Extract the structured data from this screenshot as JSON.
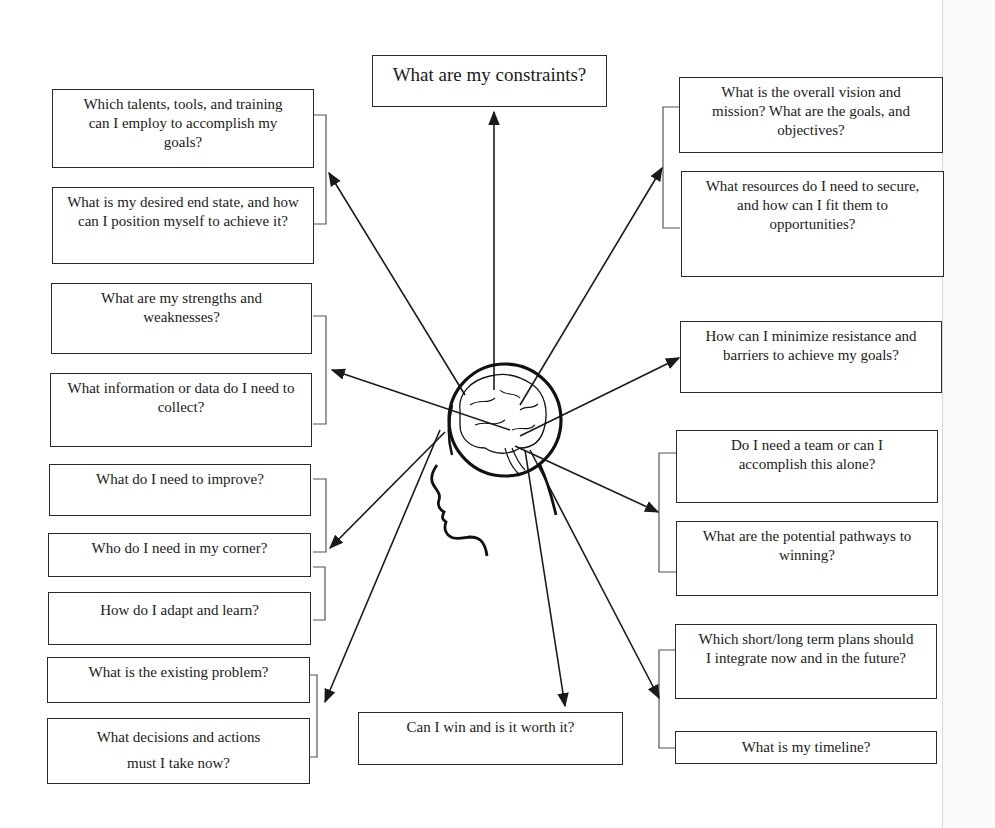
{
  "diagram": {
    "center": {
      "label": "head-with-brain"
    },
    "top": {
      "text": "What are my constraints?"
    },
    "bottom": {
      "text": "Can I win and is it worth it?"
    },
    "left_boxes": [
      {
        "text": "Which talents, tools, and training can I employ to accomplish my goals?"
      },
      {
        "text": "What is my desired end state, and how can I position myself to achieve it?"
      },
      {
        "text": "What are my strengths and weaknesses?"
      },
      {
        "text": "What information or data do I need to collect?"
      },
      {
        "text": "What do I need to improve?"
      },
      {
        "text": "Who do I need in my corner?"
      },
      {
        "text": "How do I adapt and learn?"
      },
      {
        "text": "What is the existing problem?"
      },
      {
        "text": "What decisions and actions must I take now?"
      }
    ],
    "right_boxes": [
      {
        "text": "What is the overall vision and mission? What are the goals, and objectives?"
      },
      {
        "text": "What resources do I need to secure, and how can I fit them to opportunities?"
      },
      {
        "text": "How can I minimize resistance and barriers to achieve my goals?"
      },
      {
        "text": "Do I need a team or can I accomplish this alone?"
      },
      {
        "text": "What are the potential pathways to winning?"
      },
      {
        "text": "Which short/long term plans should I integrate now and in the future?"
      },
      {
        "text": "What is my timeline?"
      }
    ],
    "colors": {
      "line": "#1a1a1a",
      "box_border": "#2a2a2a",
      "background": "#ffffff"
    }
  }
}
